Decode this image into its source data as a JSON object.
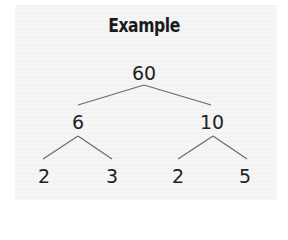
{
  "title": "Example",
  "colors": {
    "text": "#222222",
    "edge": "#6a6a6a",
    "panel": "#f3f3f3"
  },
  "tree": {
    "root": {
      "value": "60",
      "x": 144,
      "y": 63
    },
    "level1": [
      {
        "value": "6",
        "x": 78,
        "y": 112
      },
      {
        "value": "10",
        "x": 212,
        "y": 112
      }
    ],
    "level2": [
      {
        "value": "2",
        "x": 44,
        "y": 166
      },
      {
        "value": "3",
        "x": 112,
        "y": 166
      },
      {
        "value": "2",
        "x": 178,
        "y": 166
      },
      {
        "value": "5",
        "x": 245,
        "y": 166
      }
    ],
    "edges": [
      {
        "from": "60",
        "to": "6",
        "x1": 144,
        "y1": 85,
        "x2": 78,
        "y2": 105
      },
      {
        "from": "60",
        "to": "10",
        "x1": 144,
        "y1": 85,
        "x2": 211,
        "y2": 105
      },
      {
        "from": "6",
        "to": "2",
        "x1": 78,
        "y1": 136,
        "x2": 43,
        "y2": 159
      },
      {
        "from": "6",
        "to": "3",
        "x1": 78,
        "y1": 136,
        "x2": 112,
        "y2": 159
      },
      {
        "from": "10",
        "to": "2",
        "x1": 213,
        "y1": 136,
        "x2": 178,
        "y2": 159
      },
      {
        "from": "10",
        "to": "5",
        "x1": 213,
        "y1": 136,
        "x2": 247,
        "y2": 159
      }
    ]
  }
}
